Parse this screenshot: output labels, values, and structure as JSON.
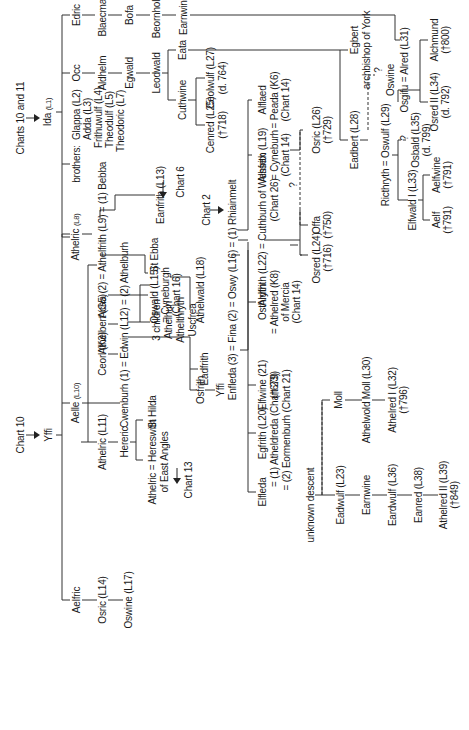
{
  "diagram": {
    "type": "genealogy-tree",
    "orientation": "rotated-90-ccw",
    "left_tree": {
      "top_ref": "Chart 10",
      "root": "Yffi",
      "children": [
        {
          "name": "Aelfric",
          "descendants": [
            "Osric (L14)",
            "Oswine (L17)"
          ]
        },
        {
          "name": "Aelle (L10)"
        },
        {
          "name": "Athelric (L11)"
        },
        {
          "name": "Ceorl (K3)"
        }
      ]
    },
    "right_tree": {
      "top_ref": "Charts 10 and 11",
      "root": "Ida (L1)",
      "children": [
        {
          "name": "Athelric (L8)"
        },
        {
          "name": "brothers:",
          "list": [
            "Glappa (L2)",
            "Adda (L3)",
            "Frithuwulf (L4)",
            "Theodulf (L5)",
            "Theodoric (L7)"
          ]
        },
        {
          "name": "Occ",
          "line": [
            "Aldhelm",
            "Egwald",
            "Leodwald"
          ]
        },
        {
          "name": "Edric",
          "line": [
            "Blaecman",
            "Bofa",
            "Beornholm",
            "Earnwine"
          ]
        }
      ]
    }
  },
  "labels": {
    "chart10": "Chart 10",
    "yffi": "Yffi",
    "charts1011": "Charts 10 and 11",
    "ida": "Ida",
    "ida_ref": "(L1)",
    "aelfric": "Aelfric",
    "aelle": "Aelle",
    "aelle_ref": "(L10)",
    "athelric_l8": "Athelric",
    "athelric_l8_ref": "(L8)",
    "brothers": "brothers:",
    "glappa": "Glappa (L2)",
    "adda": "Adda (L3)",
    "frithuwulf": "Frithuwulf (L4)",
    "theodulf": "Theodulf (L5)",
    "theodoric": "Theodoric (L7)",
    "occ": "Occ",
    "edric": "Edric",
    "osric_l14": "Osric (L14)",
    "athelric_l11": "Athelric (L11)",
    "ceorl": "Ceorl (K3)",
    "athelbert": "Athelbert (G5)",
    "acha_line": "Acha (2) = Athelfrith (L9) = (1) Bebba",
    "aldhelm": "Aldhelm",
    "blaecman": "Blaecman",
    "oswine_l17": "Oswine (L17)",
    "hereric": "Hereric",
    "cwenburh_line": "Cwenburh (1) = Edwin (L12) = (2) Athelburh",
    "egwald": "Egwald",
    "bofa": "Bofa",
    "athelric_hereswith": "Athelric = Hereswith",
    "east_angles": "of East Angles",
    "st_hilda": "St Hilda",
    "chart13": "Chart 13",
    "osfrith": "Osfrith",
    "eadfrith": "Eadfrith",
    "three_children": "3 children",
    "athelhun": "Athelhun",
    "athelthryth": "Athelthryth",
    "uscfrea": "Uscfrea",
    "oswald": "Oswald (L15)",
    "cyneburgh": "= Cyneburgh",
    "chart16": "(Chart 16)",
    "st_ebba": "St Ebba",
    "eanfrith": "Eanfrith (L13)",
    "chart6": "Chart 6",
    "leodwald": "Leodwald",
    "beornholm": "Beornholm",
    "yffi2": "Yffi",
    "athelwald_l18": "Athelwald (L18)",
    "chart2": "Chart 2",
    "oswy_line": "Enfleda (3) = Fina (2) = Oswy (L16) = (1) Rhiainmelt",
    "cuthwine": "Cuthwine",
    "eata": "Eata",
    "earnwine": "Earnwine",
    "cenred": "Cenred (L25)",
    "cenred_d": "(†718)",
    "ceolwulf": "Ceolwulf (L27)",
    "ceolwulf_d": "(d. 764)",
    "elfleda": "Elfleda",
    "egfrith": "Egfrith (L20)",
    "etheldreda": "= (1) Atheldreda (Chart 23)",
    "eormenburh": "= (2) Eormenburh (Chart 21)",
    "elfwine": "Elfwine (21)",
    "elfwine_d": "(†679)",
    "osthryth": "Osthryth",
    "athelred_k8": "= Athelred (K8)",
    "of_mercia": "of Mercia",
    "chart14a": "(Chart 14)",
    "aldfrith_line": "Aldfrith (L22) = Cuthburh of Wessex",
    "chart26": "(Chart 26)",
    "alhfrith": "Alhfrith (L19)",
    "cyneburh": "= Cyneburh",
    "chart14b": "(Chart 14)",
    "alflaed": "Alflaed",
    "peada": "= Peada (K6)",
    "chart14c": "(Chart 14)",
    "unknown_descent": "unknown descent",
    "q1": "?",
    "osred_l24": "Osred (L24)",
    "osred_l24_d": "(†716)",
    "offa": "Offa",
    "offa_d": "(†750)",
    "osric_l26": "Osric (L26)",
    "osric_l26_d": "(†729)",
    "egbert": "Egbert",
    "archbishop": "archbishop of York",
    "moll": "Moll",
    "eadwulf": "Eadwulf (L23)",
    "athelwold_moll": "Athelwold Moll (L30)",
    "earnwine2": "Earnwine",
    "eadbert": "Eadbert (L28)",
    "q2": "?",
    "oswine2": "Oswine",
    "athelred_l32": "Athelred I (L32)",
    "athelred_l32_d": "(†796)",
    "eardwulf": "Eardwulf (L36)",
    "ricthryth_line": "Ricthryth = Oswulf (L29)",
    "elfwald": "Elfwald I (L33)",
    "q3": "?",
    "eanred": "Eanred (L38)",
    "osgifu_line": "Osgifu = Alred (L31)",
    "osbald": "Osbald (L35)",
    "osbald_d": "(d. 799)",
    "athelred_ii": "Athelred II (L39)",
    "athelred_ii_d": "(†849)",
    "aelf": "Aelf",
    "aelf_d": "(†791)",
    "aelfwine": "Aelfwine",
    "aelfwine_d": "(†791)",
    "osred_ii": "Osred II (L34)",
    "osred_ii_d": "(d. 792)",
    "alchmund": "Alchmund",
    "alchmund_d": "(†800)"
  }
}
